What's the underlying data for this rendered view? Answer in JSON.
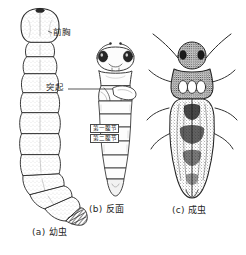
{
  "figure": {
    "type": "scientific-illustration",
    "background_color": "#ffffff",
    "ink_color": "#2b2b2b",
    "width": 246,
    "height": 255
  },
  "panels": [
    {
      "key": "a",
      "caption": "(a) 幼虫",
      "subject": "larva",
      "callouts": [
        {
          "name": "prothorax",
          "label": "前胸"
        }
      ]
    },
    {
      "key": "b",
      "caption": "(b) 反面",
      "subject": "pupa-ventral",
      "callouts": [
        {
          "name": "process",
          "label": "突起"
        },
        {
          "name": "abdominal-segment-1",
          "label": "第一腹节"
        },
        {
          "name": "abdominal-segment-2",
          "label": "第二腹节"
        }
      ]
    },
    {
      "key": "c",
      "caption": "(c) 成虫",
      "subject": "adult",
      "callouts": []
    }
  ],
  "labels": {
    "prothorax": "前胸",
    "process": "突起",
    "abdominal_segment_1": "第一腹节",
    "abdominal_segment_2": "第二腹节",
    "caption_a": "(a) 幼虫",
    "caption_b": "(b) 反面",
    "caption_c": "(c) 成虫"
  }
}
